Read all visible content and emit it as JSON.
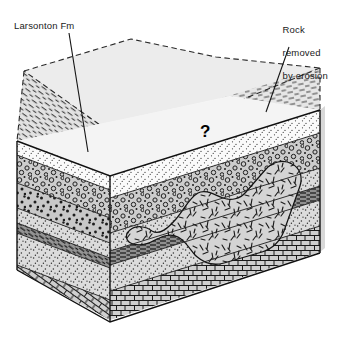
{
  "figure": {
    "kind": "geologic-block-diagram",
    "background_color": "#ffffff",
    "line_color": "#1a1a1a",
    "labels": {
      "larsonton": "Larsonton Fm",
      "erosion_line1": "Rock",
      "erosion_line2": "removed",
      "erosion_line3": "by erosion"
    },
    "annotations": {
      "question_mark": "?"
    },
    "units": [
      {
        "name": "shale-upper",
        "pattern": "dash",
        "fill": "#e9e9e9"
      },
      {
        "name": "sandstone-white",
        "pattern": "fine-stipple",
        "fill": "#fbfbfb"
      },
      {
        "name": "conglomerate",
        "pattern": "circles",
        "fill": "#cfcfcf"
      },
      {
        "name": "coarse-sandstone",
        "pattern": "coarse-dots",
        "fill": "#c9c9c9"
      },
      {
        "name": "sandstone-mid",
        "pattern": "stipple",
        "fill": "#dcdcdc"
      },
      {
        "name": "shale-lower",
        "pattern": "dash-dark",
        "fill": "#9a9a9a"
      },
      {
        "name": "sandstone-lower",
        "pattern": "stipple",
        "fill": "#dddddd"
      },
      {
        "name": "limestone",
        "pattern": "brick",
        "fill": "#cccccc"
      },
      {
        "name": "igneous-intrusion",
        "pattern": "random-ticks",
        "fill": "#d6d6d6"
      }
    ],
    "eroded_block": {
      "outline_style": "dashed",
      "fill": "#ebebeb"
    }
  }
}
